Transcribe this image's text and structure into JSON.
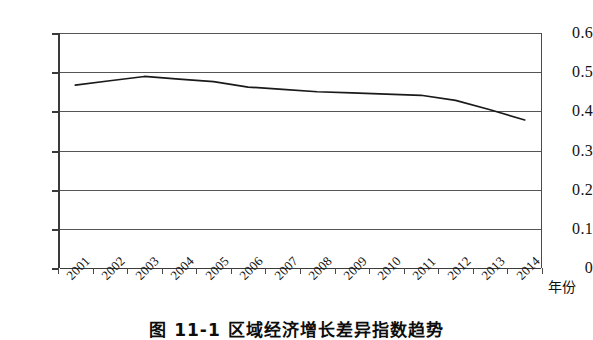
{
  "chart_data": {
    "type": "line",
    "title": "",
    "xlabel": "年份",
    "ylabel": "",
    "categories": [
      "2001",
      "2002",
      "2003",
      "2004",
      "2005",
      "2006",
      "2007",
      "2008",
      "2009",
      "2010",
      "2011",
      "2012",
      "2013",
      "2014"
    ],
    "values": [
      0.467,
      0.478,
      0.489,
      0.482,
      0.476,
      0.462,
      0.456,
      0.45,
      0.447,
      0.444,
      0.441,
      0.428,
      0.404,
      0.378
    ],
    "series": [
      {
        "name": "区域经济增长差异指数",
        "values": [
          0.467,
          0.478,
          0.489,
          0.482,
          0.476,
          0.462,
          0.456,
          0.45,
          0.447,
          0.444,
          0.441,
          0.428,
          0.404,
          0.378
        ]
      }
    ],
    "y_ticks": [
      "0",
      "0.1",
      "0.2",
      "0.3",
      "0.4",
      "0.5",
      "0.6"
    ],
    "y_tick_values": [
      0,
      0.1,
      0.2,
      0.3,
      0.4,
      0.5,
      0.6
    ],
    "ylim": [
      0,
      0.6
    ],
    "grid": true,
    "legend": false,
    "line_color": "#1a1a1a"
  },
  "axis": {
    "x_title": "年份"
  },
  "caption": {
    "text": "图 11-1 区域经济增长差异指数趋势"
  }
}
